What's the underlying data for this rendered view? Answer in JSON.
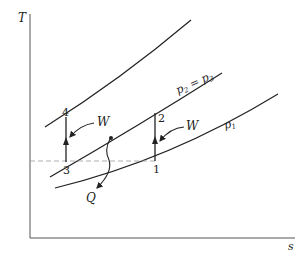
{
  "diagram": {
    "type": "T-s diagram (refrigeration / heat pump cycle)",
    "axes": {
      "y_label": "T",
      "x_label": "s"
    },
    "curves": [
      {
        "id": "upper-isobar",
        "label": ""
      },
      {
        "id": "p2-p3-isobar",
        "label": "p₂ = p₃"
      },
      {
        "id": "p1-isobar",
        "label": "p₁"
      }
    ],
    "points": [
      {
        "id": "1",
        "label": "1"
      },
      {
        "id": "2",
        "label": "2"
      },
      {
        "id": "3",
        "label": "3"
      },
      {
        "id": "4",
        "label": "4"
      }
    ],
    "annotations": {
      "work_left": "W",
      "work_right": "W",
      "heat": "Q",
      "p23_text": "p",
      "p23_sub2": "2",
      "p23_eq": " = p",
      "p23_sub3": "3",
      "p1_text": "p",
      "p1_sub": "1"
    },
    "colors": {
      "line": "#222222",
      "dashed": "#9a9a9a",
      "axis": "#555555"
    }
  }
}
